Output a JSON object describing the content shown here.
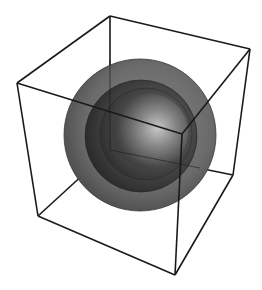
{
  "figure": {
    "background": "#ffffff",
    "cube": {
      "stroke": "#1a1a1a",
      "stroke_width": 1.6,
      "vertices": {
        "top_back": [
          110,
          16
        ],
        "top_right": [
          250,
          49
        ],
        "top_left": [
          17,
          83
        ],
        "top_front": [
          182,
          134
        ],
        "bottom_back": [
          110,
          150
        ],
        "bottom_right": [
          233,
          175
        ],
        "bottom_left": [
          38,
          216
        ],
        "bottom_front": [
          175,
          275
        ]
      }
    },
    "spheres": [
      {
        "name": "outer-shell",
        "cx": 140,
        "cy": 135,
        "r": 76,
        "color_light": "#8a8a8a",
        "color_mid": "#6a6a6a",
        "color_dark": "#4a4a4a"
      },
      {
        "name": "middle-shell",
        "cx": 141,
        "cy": 136,
        "r": 56,
        "color_light": "#7a7a7a",
        "color_mid": "#444444",
        "color_dark": "#262626"
      },
      {
        "name": "inner-shell-1",
        "cx": 146,
        "cy": 134,
        "r": 46,
        "color_light": "#9a9a9a",
        "color_mid": "#4a4a4a",
        "color_dark": "#2a2a2a"
      },
      {
        "name": "inner-shell-2",
        "cx": 150,
        "cy": 132,
        "r": 38,
        "color_light": "#c8c8c8",
        "color_mid": "#555555",
        "color_dark": "#303030"
      }
    ],
    "highlight": {
      "cx": 150,
      "cy": 128,
      "color": "#d0d0d0"
    }
  }
}
